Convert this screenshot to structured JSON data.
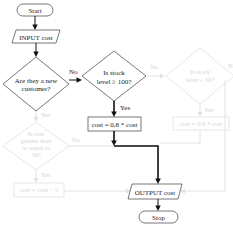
{
  "flowchart": {
    "start": "Start",
    "input": "INPUT cost",
    "decision_new_customer": {
      "line1": "Are they a new",
      "line2": "customer?"
    },
    "decision_stock_100": {
      "line1": "Is stock",
      "line2": "level ≥ 100?"
    },
    "process_discount": "cost = 0.8 * cost",
    "output": "OUTPUT cost",
    "stop": "Stop",
    "labels": {
      "no": "No",
      "yes": "Yes"
    },
    "faded": {
      "decision_stock_50": {
        "line1": "Is stock",
        "line2": "level ≥ 50?"
      },
      "process_discount_2": "cost = 0.9 * cost",
      "decision_cost_50": {
        "line1": "Is cost",
        "line2": "greater than",
        "line3": "or equal to",
        "line4": "50?"
      },
      "process_minus_5": "cost = cost − 5",
      "yes": "Yes",
      "no": "No"
    }
  }
}
